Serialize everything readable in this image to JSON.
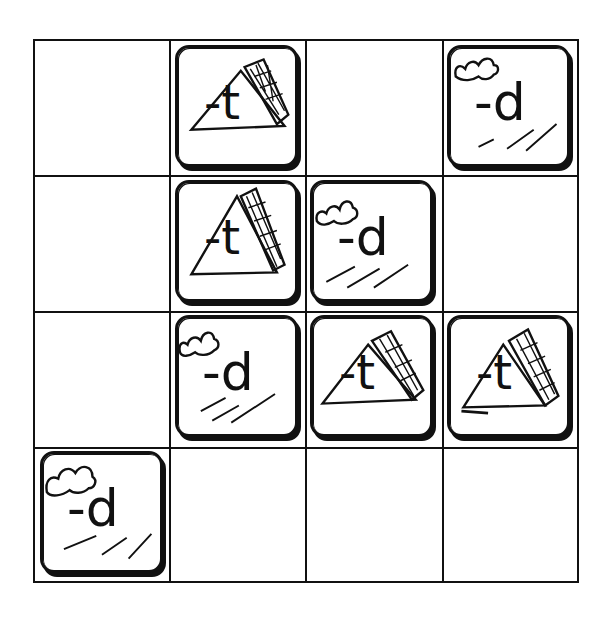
{
  "board": {
    "rows": 4,
    "cols": 4,
    "cells": [
      [
        null,
        "-t",
        null,
        "-d"
      ],
      [
        null,
        "-t",
        "-d",
        null
      ],
      [
        null,
        "-d",
        "-t",
        "-t"
      ],
      [
        "-d",
        null,
        null,
        null
      ]
    ]
  },
  "tiles": [
    {
      "row": 0,
      "col": 1,
      "label": "-t",
      "icon": "tent-icon"
    },
    {
      "row": 0,
      "col": 3,
      "label": "-d",
      "icon": "cloud-icon"
    },
    {
      "row": 1,
      "col": 1,
      "label": "-t",
      "icon": "tent-icon"
    },
    {
      "row": 1,
      "col": 2,
      "label": "-d",
      "icon": "cloud-icon"
    },
    {
      "row": 2,
      "col": 1,
      "label": "-d",
      "icon": "cloud-icon"
    },
    {
      "row": 2,
      "col": 2,
      "label": "-t",
      "icon": "tent-icon"
    },
    {
      "row": 2,
      "col": 3,
      "label": "-t",
      "icon": "tent-icon"
    },
    {
      "row": 3,
      "col": 0,
      "label": "-d",
      "icon": "cloud-icon"
    }
  ],
  "colors": {
    "ink": "#111111",
    "paper": "#ffffff"
  }
}
